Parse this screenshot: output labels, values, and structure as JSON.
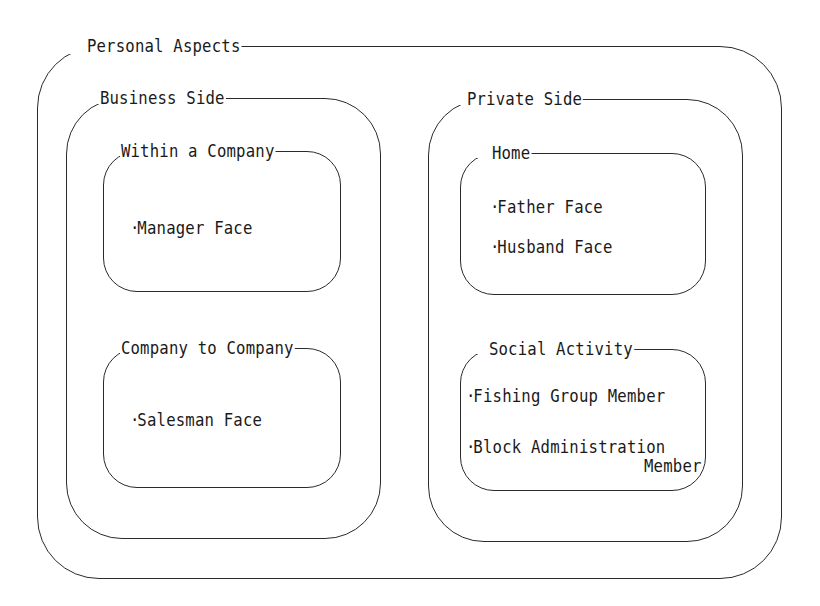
{
  "diagram": {
    "root": {
      "title": "Personal Aspects",
      "groups": [
        {
          "title": "Business Side",
          "sections": [
            {
              "title": "Within a Company",
              "items": [
                "Manager Face"
              ]
            },
            {
              "title": "Company to Company",
              "items": [
                "Salesman Face"
              ]
            }
          ]
        },
        {
          "title": "Private Side",
          "sections": [
            {
              "title": "Home",
              "items": [
                "Father Face",
                "Husband Face"
              ]
            },
            {
              "title": "Social Activity",
              "items": [
                "Fishing Group Member",
                "Block Administration"
              ],
              "continuation": "Member"
            }
          ]
        }
      ]
    },
    "bullet": "·",
    "colors": {
      "line": "#2a2a2a",
      "text": "#1a1a1a",
      "background": "#ffffff"
    }
  }
}
